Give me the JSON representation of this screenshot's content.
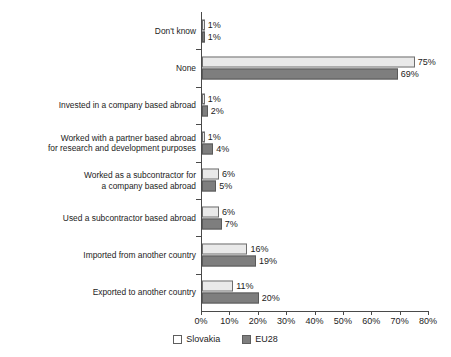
{
  "chart_data": {
    "type": "bar",
    "orientation": "horizontal",
    "title": "",
    "xlabel": "",
    "ylabel": "",
    "xlim": [
      0,
      80
    ],
    "xticks": [
      "0%",
      "10%",
      "20%",
      "30%",
      "40%",
      "50%",
      "60%",
      "70%",
      "80%"
    ],
    "grid": false,
    "legend_position": "bottom",
    "value_suffix": "%",
    "categories": [
      "Don't know",
      "None",
      "Invested in a company based abroad",
      "Worked with a partner based abroad\nfor research and development purposes",
      "Worked as a subcontractor for\na company based abroad",
      "Used a subcontractor based abroad",
      "Imported from another country",
      "Exported to another country"
    ],
    "series": [
      {
        "name": "Slovakia",
        "color": "#e9e9e9",
        "values": [
          1,
          75,
          1,
          1,
          6,
          6,
          16,
          11
        ],
        "labels": [
          "1%",
          "75%",
          "1%",
          "1%",
          "6%",
          "6%",
          "16%",
          "11%"
        ]
      },
      {
        "name": "EU28",
        "color": "#7e7e7e",
        "values": [
          1,
          69,
          2,
          4,
          5,
          7,
          19,
          20
        ],
        "labels": [
          "1%",
          "69%",
          "2%",
          "4%",
          "5%",
          "7%",
          "19%",
          "20%"
        ]
      }
    ]
  }
}
